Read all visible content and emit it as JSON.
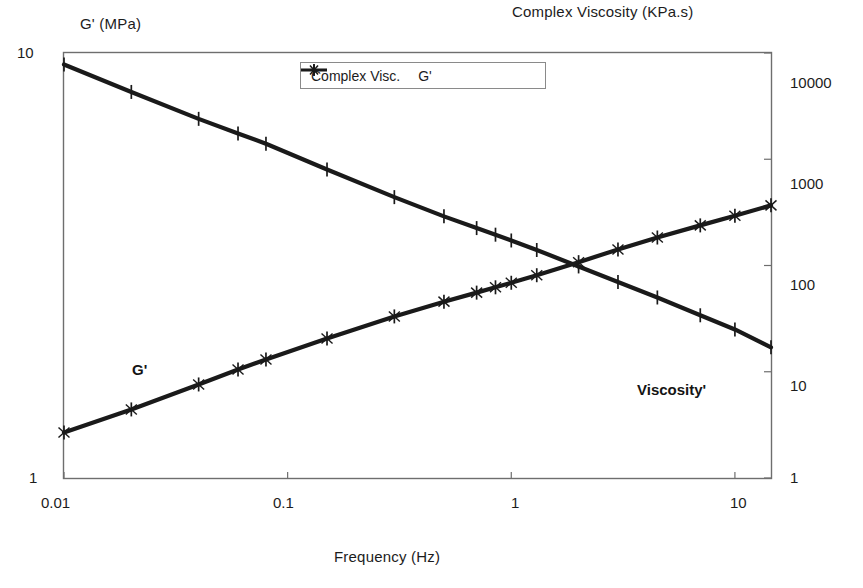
{
  "titles": {
    "left_axis": "G' (MPa)",
    "right_axis": "Complex Viscosity (KPa.s)",
    "x_axis": "Frequency (Hz)"
  },
  "legend": {
    "items": [
      {
        "label": "Complex Visc.",
        "marker": "plus-marker",
        "color": "#1a1a1a"
      },
      {
        "label": "G'",
        "marker": "star-marker",
        "color": "#1a1a1a"
      }
    ]
  },
  "annotations": [
    {
      "text": "G'",
      "name": "annotation-g-prime"
    },
    {
      "text": "Viscosity'",
      "name": "annotation-viscosity"
    }
  ],
  "axes": {
    "x_ticks": [
      "0.01",
      "0.1",
      "1",
      "10"
    ],
    "y_left_ticks": [
      "10",
      "1"
    ],
    "y_right_ticks": [
      "10000",
      "1000",
      "100",
      "10",
      "1"
    ]
  },
  "chart_data": {
    "type": "line",
    "title": "",
    "subtitle": "",
    "xlabel": "Frequency (Hz)",
    "ylabel": "G' (MPa)",
    "y2label": "Complex Viscosity (KPa.s)",
    "xscale": "log",
    "yscale": "log",
    "xlim": [
      0.01,
      14.5
    ],
    "ylim": [
      1,
      10
    ],
    "y2lim": [
      1,
      10000
    ],
    "grid": false,
    "legend_position": "top-center",
    "x_tick_values": [
      0.01,
      0.1,
      1,
      10
    ],
    "y_left_tick_values": [
      1,
      10
    ],
    "y_right_tick_values": [
      1,
      10,
      100,
      1000,
      10000
    ],
    "series": [
      {
        "name": "Complex Visc.",
        "axis": "right",
        "marker": "plus",
        "color": "#1a1a1a",
        "x": [
          0.01,
          0.02,
          0.04,
          0.06,
          0.08,
          0.15,
          0.3,
          0.5,
          0.7,
          0.85,
          1.0,
          1.3,
          2.0,
          3.0,
          4.5,
          7.0,
          10.0,
          14.5
        ],
        "y": [
          7800,
          4300,
          2400,
          1750,
          1400,
          800,
          440,
          290,
          225,
          195,
          172,
          140,
          98,
          70,
          50,
          34,
          25,
          17
        ]
      },
      {
        "name": "G'",
        "axis": "left",
        "marker": "star",
        "color": "#1a1a1a",
        "x": [
          0.01,
          0.02,
          0.04,
          0.06,
          0.08,
          0.15,
          0.3,
          0.5,
          0.7,
          0.85,
          1.0,
          1.3,
          2.0,
          3.0,
          4.5,
          7.0,
          10.0,
          14.5
        ],
        "y": [
          1.28,
          1.45,
          1.66,
          1.8,
          1.9,
          2.13,
          2.4,
          2.6,
          2.73,
          2.81,
          2.88,
          3.0,
          3.22,
          3.45,
          3.68,
          3.93,
          4.14,
          4.38
        ]
      }
    ],
    "crossover": {
      "x": 1.35,
      "note": "G' and Complex Viscosity curves intersect"
    }
  }
}
